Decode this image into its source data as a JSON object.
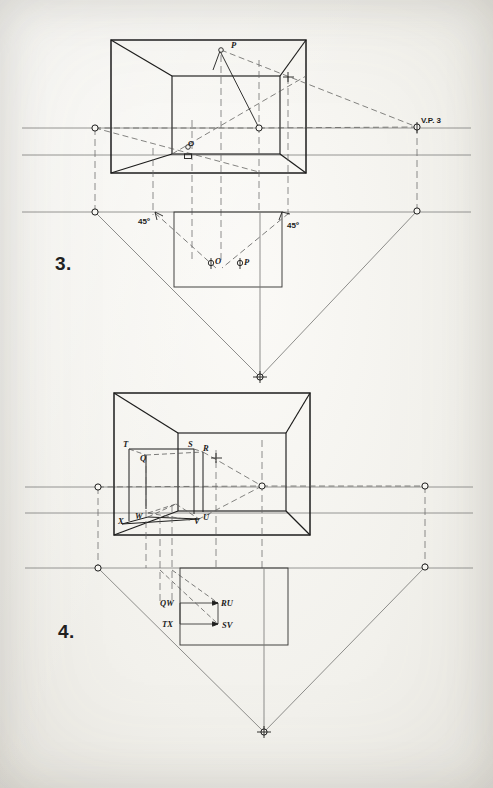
{
  "document": {
    "kind": "technical-drawing",
    "title": "Three-point perspective construction plates",
    "background_color": "#f2f1ec",
    "ink_color": "#1d1d1c",
    "construction_color": "#6e6e6c"
  },
  "figures": [
    {
      "id": "fig3",
      "number_label": "3.",
      "number_pos": {
        "x": 55,
        "y": 253
      },
      "description": "Three-point perspective cube interior with station point O and point P located in plan at 45 degrees",
      "labels": [
        {
          "name": "point-p-pictorial",
          "text": "P",
          "x": 231,
          "y": 40,
          "style": "italic"
        },
        {
          "name": "point-o-pictorial",
          "text": "O",
          "x": 188,
          "y": 151,
          "style": "upright"
        },
        {
          "name": "vanishing-point-3",
          "text": "V.P. 3",
          "x": 421,
          "y": 116,
          "style": "caps"
        },
        {
          "name": "angle-left-45",
          "text": "45º",
          "x": 146,
          "y": 219,
          "style": "caps"
        },
        {
          "name": "angle-right-45",
          "text": "45º",
          "x": 284,
          "y": 222,
          "style": "caps"
        },
        {
          "name": "point-o-plan",
          "text": "O",
          "x": 216,
          "y": 259,
          "style": "italic"
        },
        {
          "name": "point-p-plan",
          "text": "P",
          "x": 246,
          "y": 260,
          "style": "italic"
        }
      ],
      "horizon_lines": [
        {
          "name": "upper-horizon-line",
          "y": 128
        },
        {
          "name": "lower-horizon-line",
          "y": 155
        },
        {
          "name": "ground-line",
          "y": 212
        }
      ],
      "vanishing_points": [
        {
          "name": "vp-left-upper",
          "x": 95,
          "y": 128
        },
        {
          "name": "vp-center",
          "x": 259,
          "y": 128
        },
        {
          "name": "vp-right-3",
          "x": 417,
          "y": 127
        },
        {
          "name": "vp-left-ground",
          "x": 95,
          "y": 212
        },
        {
          "name": "vp-right-ground",
          "x": 417,
          "y": 211
        },
        {
          "name": "vp-bottom",
          "x": 260,
          "y": 377
        }
      ]
    },
    {
      "id": "fig4",
      "number_label": "4.",
      "number_pos": {
        "x": 58,
        "y": 621
      },
      "description": "Three-point perspective cube interior containing an inscribed prism with vertices Q R S T U V W X and its plan projection",
      "labels": [
        {
          "name": "vertex-t",
          "text": "T",
          "x": 122,
          "y": 443,
          "style": "italic"
        },
        {
          "name": "vertex-q",
          "text": "Q",
          "x": 140,
          "y": 458,
          "style": "italic"
        },
        {
          "name": "vertex-s",
          "text": "S",
          "x": 188,
          "y": 444,
          "style": "italic"
        },
        {
          "name": "vertex-r",
          "text": "R",
          "x": 202,
          "y": 448,
          "style": "italic"
        },
        {
          "name": "vertex-x",
          "text": "X",
          "x": 119,
          "y": 516,
          "style": "italic"
        },
        {
          "name": "vertex-w",
          "text": "W",
          "x": 136,
          "y": 513,
          "style": "italic"
        },
        {
          "name": "vertex-v",
          "text": "V",
          "x": 195,
          "y": 519,
          "style": "italic"
        },
        {
          "name": "vertex-u",
          "text": "U",
          "x": 203,
          "y": 515,
          "style": "italic"
        },
        {
          "name": "plan-label-qw",
          "text": "QW",
          "x": 164,
          "y": 606,
          "style": "italic"
        },
        {
          "name": "plan-label-ru",
          "text": "RU",
          "x": 222,
          "y": 606,
          "style": "italic"
        },
        {
          "name": "plan-label-tx",
          "text": "TX",
          "x": 166,
          "y": 626,
          "style": "italic"
        },
        {
          "name": "plan-label-sv",
          "text": "SV",
          "x": 223,
          "y": 627,
          "style": "italic"
        }
      ],
      "horizon_lines": [
        {
          "name": "upper-horizon-line",
          "y": 487
        },
        {
          "name": "lower-horizon-line",
          "y": 513
        },
        {
          "name": "ground-line",
          "y": 568
        }
      ],
      "vanishing_points": [
        {
          "name": "vp-left-upper",
          "x": 98,
          "y": 487
        },
        {
          "name": "vp-center",
          "x": 262,
          "y": 486
        },
        {
          "name": "vp-right-upper",
          "x": 425,
          "y": 486
        },
        {
          "name": "vp-left-ground",
          "x": 98,
          "y": 568
        },
        {
          "name": "vp-right-ground",
          "x": 425,
          "y": 567
        },
        {
          "name": "vp-bottom",
          "x": 264,
          "y": 732
        }
      ]
    }
  ]
}
